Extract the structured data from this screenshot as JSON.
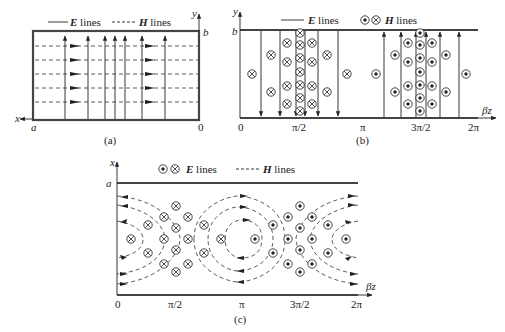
{
  "figure": {
    "panel_a": {
      "caption": "(a)",
      "legend_e_label": "E",
      "legend_e_suffix": " lines",
      "legend_h_label": "H",
      "legend_h_suffix": " lines",
      "axis_x": "x",
      "axis_y": "y",
      "corner_a": "a",
      "corner_b": "b",
      "origin": "0"
    },
    "panel_b": {
      "caption": "(b)",
      "legend_e_label": "E",
      "legend_e_suffix": " lines",
      "legend_h_label": "H",
      "legend_h_suffix": " lines",
      "axis_y": "y",
      "axis_z": "βz",
      "corner_b": "b",
      "ticks": [
        "0",
        "π/2",
        "π",
        "3π/2",
        "2π"
      ]
    },
    "panel_c": {
      "caption": "(c)",
      "legend_e_label": "E",
      "legend_e_suffix": " lines",
      "legend_h_label": "H",
      "legend_h_suffix": " lines",
      "axis_x": "x",
      "axis_z": "βz",
      "corner_a": "a",
      "ticks": [
        "0",
        "π/2",
        "π",
        "3π/2",
        "2π"
      ]
    },
    "colors": {
      "line": "#222222",
      "wall": "#444444"
    }
  }
}
